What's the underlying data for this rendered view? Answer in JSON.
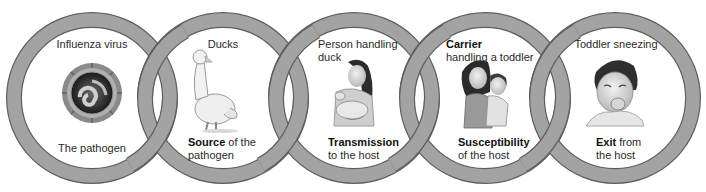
{
  "diagram": {
    "type": "chain-of-infection",
    "ring_color": "#a3a3a3",
    "ring_outline": "#5e5e5e",
    "links": [
      {
        "id": "pathogen",
        "top_label": "Influenza virus",
        "illustration": "influenza-virus",
        "bottom_bold": "",
        "bottom_label": "The pathogen",
        "bottom_line2": ""
      },
      {
        "id": "source",
        "top_label": "Ducks",
        "illustration": "duck",
        "bottom_bold": "Source",
        "bottom_label": " of the",
        "bottom_line2": "pathogen"
      },
      {
        "id": "transmission",
        "top_label": "Person handling",
        "top_line2": "duck",
        "illustration": "woman-holding-duck",
        "bottom_bold": "Transmission",
        "bottom_label": "",
        "bottom_line2": "to the host"
      },
      {
        "id": "susceptibility",
        "top_bold": "Carrier",
        "top_label": "handling a toddler",
        "illustration": "woman-holding-toddler",
        "bottom_bold": "Susceptibility",
        "bottom_label": "",
        "bottom_line2": "of the host"
      },
      {
        "id": "exit",
        "top_label": "Toddler sneezing",
        "illustration": "toddler-sneezing",
        "bottom_bold": "Exit",
        "bottom_label": " from",
        "bottom_line2": "the host"
      }
    ]
  }
}
